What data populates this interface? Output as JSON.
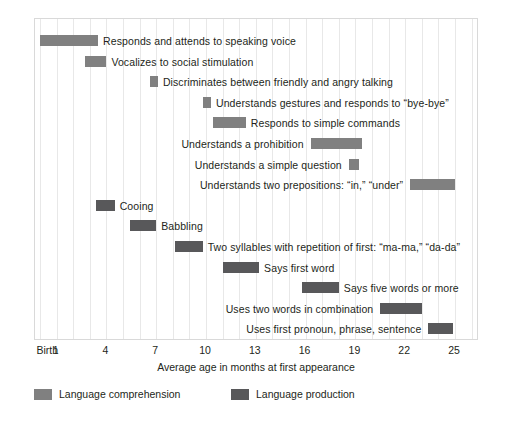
{
  "chart_data": {
    "type": "bar",
    "title": "",
    "subtitle": "",
    "xlabel": "Average age in months at first appearance",
    "ylabel": "",
    "xlim": [
      0,
      26.6
    ],
    "grid": true,
    "orientation": "horizontal-range",
    "tick_labels": [
      "Birth",
      "1",
      "4",
      "7",
      "10",
      "13",
      "16",
      "19",
      "22",
      "25"
    ],
    "tick_values": [
      0,
      1,
      4,
      7,
      10,
      13,
      16,
      19,
      22,
      25
    ],
    "gridline_values": [
      0,
      1,
      2,
      3,
      4,
      5,
      6,
      7,
      8,
      9,
      10,
      11,
      12,
      13,
      14,
      15,
      16,
      17,
      18,
      19,
      20,
      21,
      22,
      23,
      24,
      25,
      26
    ],
    "legend": {
      "position": "bottom-left",
      "entries": [
        {
          "name": "Language comprehension",
          "color": "#808080"
        },
        {
          "name": "Language production",
          "color": "#58585a"
        }
      ]
    },
    "series": [
      {
        "name": "Language comprehension",
        "color": "#808080",
        "items": [
          {
            "label": "Responds and attends to speaking voice",
            "start": 0.0,
            "end": 3.5,
            "label_side": "right"
          },
          {
            "label": "Vocalizes to social stimulation",
            "start": 2.7,
            "end": 4.0,
            "label_side": "right"
          },
          {
            "label": "Discriminates between friendly and angry talking",
            "start": 6.6,
            "end": 7.1,
            "label_side": "right"
          },
          {
            "label": "Understands gestures and responds to “bye-bye”",
            "start": 9.8,
            "end": 10.3,
            "label_side": "right"
          },
          {
            "label": "Responds to simple commands",
            "start": 10.4,
            "end": 12.4,
            "label_side": "right"
          },
          {
            "label": "Understands a prohibition",
            "start": 16.3,
            "end": 19.4,
            "label_side": "left"
          },
          {
            "label": "Understands a simple question",
            "start": 18.6,
            "end": 19.2,
            "label_side": "left"
          },
          {
            "label": "Understands two prepositions: “in,” “under”",
            "start": 22.3,
            "end": 25.0,
            "label_side": "left"
          }
        ]
      },
      {
        "name": "Language production",
        "color": "#58585a",
        "items": [
          {
            "label": "Cooing",
            "start": 3.4,
            "end": 4.5,
            "label_side": "right"
          },
          {
            "label": "Babbling",
            "start": 5.4,
            "end": 7.0,
            "label_side": "right"
          },
          {
            "label": "Two syllables with repetition of first: “ma-ma,” “da-da”",
            "start": 8.1,
            "end": 9.8,
            "label_side": "right"
          },
          {
            "label": "Says first word",
            "start": 11.0,
            "end": 13.2,
            "label_side": "right"
          },
          {
            "label": "Says five words or more",
            "start": 15.8,
            "end": 18.0,
            "label_side": "right"
          },
          {
            "label": "Uses two words in combination",
            "start": 20.5,
            "end": 23.0,
            "label_side": "left"
          },
          {
            "label": "Uses first pronoun, phrase, sentence",
            "start": 23.4,
            "end": 24.9,
            "label_side": "left"
          }
        ]
      }
    ],
    "rows_order": [
      {
        "series": 0,
        "item": 0
      },
      {
        "series": 0,
        "item": 1
      },
      {
        "series": 0,
        "item": 2
      },
      {
        "series": 0,
        "item": 3
      },
      {
        "series": 0,
        "item": 4
      },
      {
        "series": 0,
        "item": 5
      },
      {
        "series": 0,
        "item": 6
      },
      {
        "series": 0,
        "item": 7
      },
      {
        "series": 1,
        "item": 0
      },
      {
        "series": 1,
        "item": 1
      },
      {
        "series": 1,
        "item": 2
      },
      {
        "series": 1,
        "item": 3
      },
      {
        "series": 1,
        "item": 4
      },
      {
        "series": 1,
        "item": 5
      },
      {
        "series": 1,
        "item": 6
      }
    ]
  }
}
